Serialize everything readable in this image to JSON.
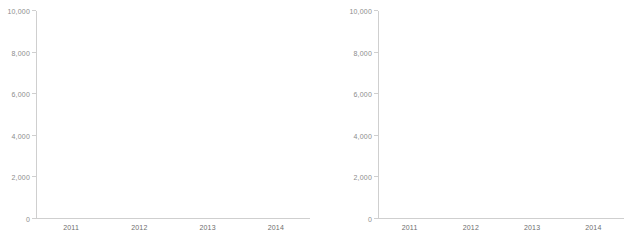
{
  "figure": {
    "background_color": "#ffffff",
    "panel_count": 2
  },
  "colors": {
    "series_top": "#b3b3b3",
    "series_bottom": "#262626",
    "axis": "#cfcfcf",
    "tick_text": "#8c8c8c",
    "category_text": "#6e6e6e"
  },
  "chart_data": [
    {
      "type": "bar",
      "stacked": true,
      "title": "",
      "subtitle": "",
      "xlabel": "",
      "ylabel": "",
      "categories": [
        "2011",
        "2012",
        "2013",
        "2014"
      ],
      "series": [
        {
          "name": "lower",
          "color": "#262626",
          "values": [
            1350,
            1450,
            1680,
            2380
          ]
        },
        {
          "name": "upper",
          "color": "#b3b3b3",
          "values": [
            4550,
            4750,
            5920,
            7720
          ]
        }
      ],
      "totals": [
        5900,
        6200,
        7600,
        10100
      ],
      "ylim": [
        0,
        10000
      ],
      "yticks": [
        0,
        2000,
        4000,
        6000,
        8000,
        10000
      ],
      "ytick_labels": [
        "0",
        "2,000",
        "4,000",
        "6,000",
        "8,000",
        "10,000"
      ],
      "grid": false,
      "legend": "none"
    },
    {
      "type": "bar",
      "stacked": true,
      "title": "",
      "subtitle": "",
      "xlabel": "",
      "ylabel": "",
      "categories": [
        "2011",
        "2012",
        "2013",
        "2014"
      ],
      "series": [
        {
          "name": "lower",
          "color": "#262626",
          "values": [
            1350,
            1450,
            1680,
            2380
          ]
        },
        {
          "name": "upper",
          "color": "#b3b3b3",
          "values": [
            4550,
            4750,
            5920,
            7720
          ]
        }
      ],
      "totals": [
        5900,
        6200,
        7600,
        10100
      ],
      "ylim": [
        0,
        10000
      ],
      "yticks": [
        0,
        2000,
        4000,
        6000,
        8000,
        10000
      ],
      "ytick_labels": [
        "0",
        "2,000",
        "4,000",
        "6,000",
        "8,000",
        "10,000"
      ],
      "grid": false,
      "legend": "none"
    }
  ]
}
